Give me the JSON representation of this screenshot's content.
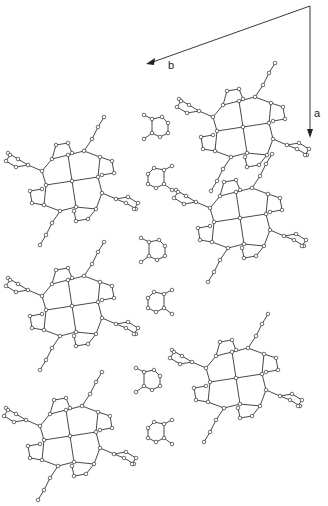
{
  "figure": {
    "type": "crystal packing diagram",
    "axes": [
      {
        "label": "b",
        "direction": "left-down"
      },
      {
        "label": "a",
        "direction": "down"
      }
    ],
    "large_molecules": [
      {
        "x": 243,
        "y": 127
      },
      {
        "x": 72,
        "y": 181
      },
      {
        "x": 240,
        "y": 218
      },
      {
        "x": 72,
        "y": 306
      },
      {
        "x": 236,
        "y": 378
      },
      {
        "x": 70,
        "y": 436
      }
    ],
    "small_molecules": [
      {
        "x": 158,
        "y": 127,
        "flip": false
      },
      {
        "x": 158,
        "y": 178,
        "flip": true
      },
      {
        "x": 155,
        "y": 250,
        "flip": false
      },
      {
        "x": 158,
        "y": 302,
        "flip": true
      },
      {
        "x": 150,
        "y": 380,
        "flip": false
      },
      {
        "x": 158,
        "y": 432,
        "flip": true
      }
    ]
  }
}
